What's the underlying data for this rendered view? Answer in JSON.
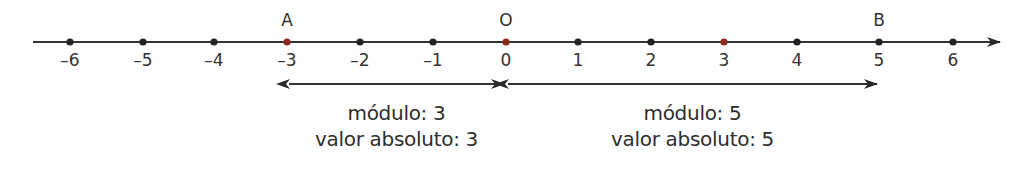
{
  "diagram": {
    "title": "",
    "axis": {
      "ticks": [
        {
          "value": -6,
          "label": "–6",
          "x": 70,
          "color": "#222222"
        },
        {
          "value": -5,
          "label": "–5",
          "x": 143,
          "color": "#222222"
        },
        {
          "value": -4,
          "label": "–4",
          "x": 214,
          "color": "#222222"
        },
        {
          "value": -3,
          "label": "–3",
          "x": 287,
          "color": "#8b2a1a"
        },
        {
          "value": -2,
          "label": "–2",
          "x": 360,
          "color": "#222222"
        },
        {
          "value": -1,
          "label": "–1",
          "x": 433,
          "color": "#222222"
        },
        {
          "value": 0,
          "label": "0",
          "x": 506,
          "color": "#8b2a1a"
        },
        {
          "value": 1,
          "label": "1",
          "x": 578,
          "color": "#222222"
        },
        {
          "value": 2,
          "label": "2",
          "x": 651,
          "color": "#222222"
        },
        {
          "value": 3,
          "label": "3",
          "x": 724,
          "color": "#8b2a1a"
        },
        {
          "value": 4,
          "label": "4",
          "x": 797,
          "color": "#222222"
        },
        {
          "value": 5,
          "label": "5",
          "x": 879,
          "color": "#222222"
        },
        {
          "value": 6,
          "label": "6",
          "x": 953,
          "color": "#222222"
        }
      ]
    },
    "points": [
      {
        "name": "A",
        "value": -3,
        "x": 287
      },
      {
        "name": "O",
        "value": 0,
        "x": 506
      },
      {
        "name": "B",
        "value": 5,
        "x": 879
      }
    ],
    "intervals": [
      {
        "from": -3,
        "to": 0,
        "x1": 287,
        "x2": 506,
        "line1": "módulo: 3",
        "line2": "valor absoluto: 3"
      },
      {
        "from": 0,
        "to": 5,
        "x1": 506,
        "x2": 879,
        "line1": "módulo: 5",
        "line2": "valor absoluto: 5"
      }
    ],
    "colors": {
      "line": "#333333",
      "dot": "#222222",
      "highlight_dot": "#8b2a1a",
      "text": "#333333"
    }
  }
}
